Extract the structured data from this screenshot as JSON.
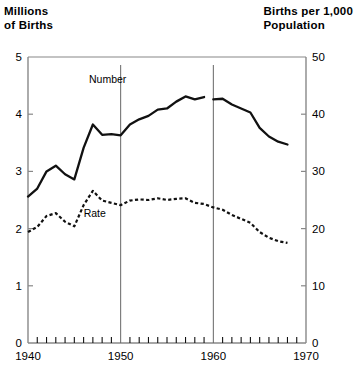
{
  "chart_data": {
    "type": "line",
    "title": "",
    "left_axis": {
      "label": "Millions\nof Births",
      "ticks": [
        0,
        1,
        2,
        3,
        4,
        5
      ],
      "tick_labels": [
        "0",
        "1",
        "2",
        "3",
        "4",
        "5"
      ],
      "ylim": [
        0,
        5
      ]
    },
    "right_axis": {
      "label": "Births per 1,000\nPopulation",
      "ticks": [
        0,
        10,
        20,
        30,
        40,
        50
      ],
      "tick_labels": [
        "0",
        "10",
        "20",
        "30",
        "40",
        "50"
      ],
      "ylim": [
        0,
        50
      ]
    },
    "xlabel": "",
    "x_tick_labels": [
      "1940",
      "1950",
      "1960",
      "1970"
    ],
    "x_major_ticks": [
      1940,
      1950,
      1960,
      1970
    ],
    "xlim": [
      1940,
      1970
    ],
    "grid": false,
    "reference_lines": [
      1950,
      1960
    ],
    "legend_position": "inline-annotation",
    "series": [
      {
        "name": "Number",
        "label": "Number",
        "axis": "left",
        "style": "solid",
        "units": "millions of births",
        "x": [
          1940,
          1941,
          1942,
          1943,
          1944,
          1945,
          1946,
          1947,
          1948,
          1949,
          1950,
          1951,
          1952,
          1953,
          1954,
          1955,
          1956,
          1957,
          1958,
          1959,
          1960,
          1961,
          1962,
          1963,
          1964,
          1965,
          1966,
          1967,
          1968
        ],
        "values": [
          2.56,
          2.7,
          3.0,
          3.1,
          2.95,
          2.86,
          3.41,
          3.82,
          3.64,
          3.65,
          3.63,
          3.82,
          3.91,
          3.97,
          4.08,
          4.1,
          4.22,
          4.31,
          4.26,
          4.3,
          4.26,
          4.27,
          4.17,
          4.1,
          4.03,
          3.76,
          3.61,
          3.52,
          3.47
        ],
        "values_right_scale": null
      },
      {
        "name": "Rate",
        "label": "Rate",
        "axis": "right",
        "style": "dotted",
        "units": "births per 1,000 population",
        "x": [
          1940,
          1941,
          1942,
          1943,
          1944,
          1945,
          1946,
          1947,
          1948,
          1949,
          1950,
          1951,
          1952,
          1953,
          1954,
          1955,
          1956,
          1957,
          1958,
          1959,
          1960,
          1961,
          1962,
          1963,
          1964,
          1965,
          1966,
          1967,
          1968
        ],
        "values": [
          19.4,
          20.3,
          22.2,
          22.7,
          21.2,
          20.4,
          24.1,
          26.6,
          24.9,
          24.5,
          24.1,
          24.9,
          25.1,
          25.0,
          25.3,
          25.0,
          25.2,
          25.3,
          24.5,
          24.3,
          23.7,
          23.3,
          22.4,
          21.7,
          21.0,
          19.4,
          18.4,
          17.8,
          17.5
        ]
      }
    ],
    "annotations": [
      {
        "text": "Number",
        "x": 1948.6,
        "y_left": 4.55
      },
      {
        "text": "Rate",
        "x": 1947.2,
        "y_right": 22.1
      }
    ],
    "line_break": {
      "series": "Number",
      "between": [
        1959,
        1960
      ],
      "note": "small gap in solid line"
    },
    "colors": {
      "line": "#111111",
      "axis": "#888888",
      "reference_line": "#666666",
      "background": "#ffffff"
    }
  }
}
